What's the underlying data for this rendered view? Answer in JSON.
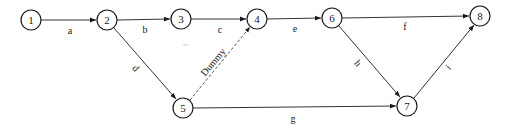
{
  "diagram": {
    "type": "activity-on-arrow network",
    "nodes": [
      {
        "id": "1",
        "label": "1",
        "x": 31,
        "y": 20
      },
      {
        "id": "2",
        "label": "2",
        "x": 107,
        "y": 20
      },
      {
        "id": "3",
        "label": "3",
        "x": 181,
        "y": 19
      },
      {
        "id": "4",
        "label": "4",
        "x": 257,
        "y": 19
      },
      {
        "id": "5",
        "label": "5",
        "x": 183,
        "y": 108
      },
      {
        "id": "6",
        "label": "6",
        "x": 332,
        "y": 18
      },
      {
        "id": "7",
        "label": "7",
        "x": 407,
        "y": 106
      },
      {
        "id": "8",
        "label": "8",
        "x": 480,
        "y": 16
      }
    ],
    "edges": [
      {
        "from": "1",
        "to": "2",
        "label": "a",
        "dummy": false
      },
      {
        "from": "2",
        "to": "3",
        "label": "b",
        "dummy": false
      },
      {
        "from": "3",
        "to": "4",
        "label": "c",
        "dummy": false
      },
      {
        "from": "2",
        "to": "5",
        "label": "d",
        "dummy": false
      },
      {
        "from": "5",
        "to": "4",
        "label": "Dummy",
        "dummy": true
      },
      {
        "from": "4",
        "to": "6",
        "label": "e",
        "dummy": false
      },
      {
        "from": "6",
        "to": "8",
        "label": "f",
        "dummy": false
      },
      {
        "from": "5",
        "to": "7",
        "label": "g",
        "dummy": false
      },
      {
        "from": "6",
        "to": "7",
        "label": "h",
        "dummy": false
      },
      {
        "from": "7",
        "to": "8",
        "label": "i",
        "dummy": false
      }
    ]
  }
}
